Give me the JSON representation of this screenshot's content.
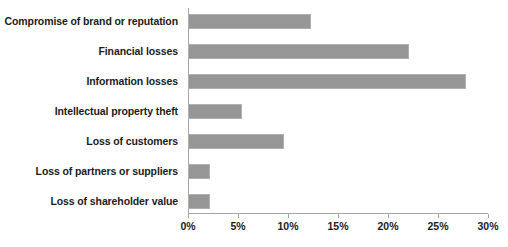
{
  "chart_data": {
    "type": "bar",
    "orientation": "horizontal",
    "title": "",
    "xlabel": "",
    "ylabel": "",
    "xlim": [
      0,
      30
    ],
    "xticks": [
      0,
      5,
      10,
      15,
      20,
      25,
      30
    ],
    "xtick_labels": [
      "0%",
      "5%",
      "10%",
      "15%",
      "20%",
      "25%",
      "30%"
    ],
    "grid": false,
    "legend": null,
    "bar_color": "#969696",
    "bar_edge_color": "#b0b0b0",
    "axis_color": "#a6a6a6",
    "background_color": "#ffffff",
    "text_color": "#1c1c1c",
    "categories": [
      "Compromise of brand or reputation",
      "Financial losses",
      "Information losses",
      "Intellectual property theft",
      "Loss of customers",
      "Loss of partners or suppliers",
      "Loss of shareholder value"
    ],
    "values": [
      12.3,
      22.1,
      27.8,
      5.4,
      9.6,
      2.2,
      2.2
    ],
    "value_labels": [
      "12.3%",
      "22.1%",
      "27.8%",
      "5.4%",
      "9.6%",
      "2.2%",
      "2.2%"
    ]
  }
}
